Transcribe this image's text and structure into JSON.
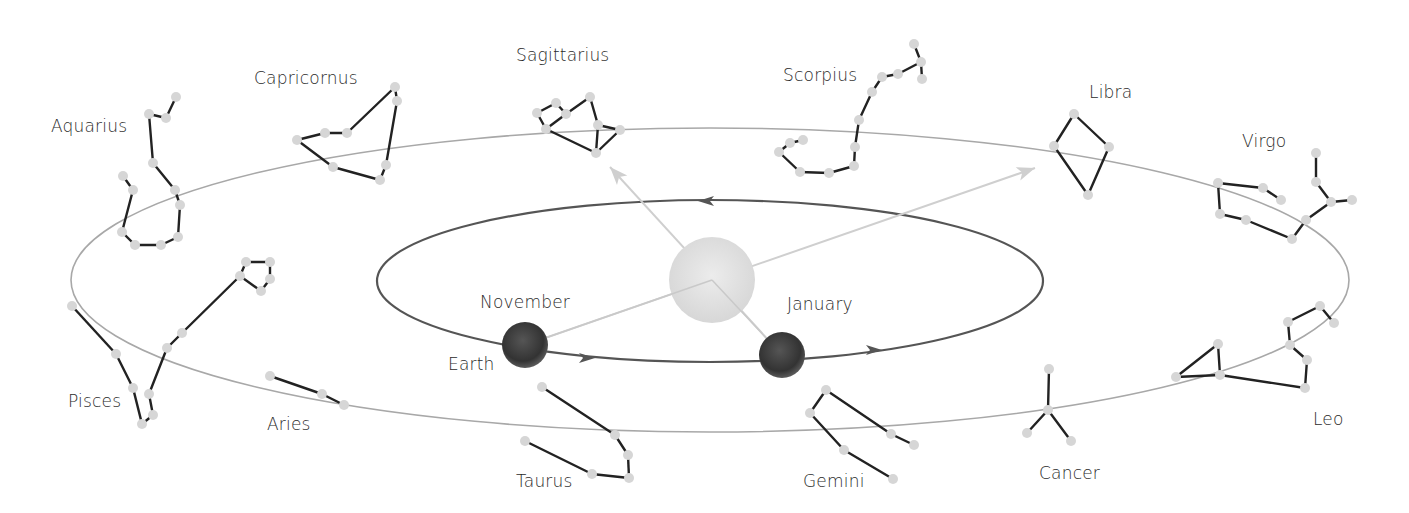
{
  "diagram": {
    "colors": {
      "background": "#ffffff",
      "ecliptic": "#a8a8a8",
      "orbit": "#555555",
      "sight_line": "#cfcfcf",
      "star": "#d6d6d6",
      "constellation_line": "#222222",
      "sun": "#dcdcdc",
      "earth": "#3a3a3a",
      "label": "#2b2b2b"
    },
    "ecliptic": {
      "cx": 710,
      "cy": 280,
      "rx": 639,
      "ry": 152
    },
    "orbit": {
      "cx": 710,
      "cy": 281,
      "rx": 333,
      "ry": 81,
      "arrows": [
        [
          588,
          358,
          1
        ],
        [
          875,
          350,
          1
        ],
        [
          705,
          201,
          -1
        ]
      ]
    },
    "sun": {
      "cx": 712,
      "cy": 280,
      "r": 43
    },
    "earth_positions": [
      {
        "name": "november",
        "label": "November",
        "cx": 525,
        "cy": 345,
        "r": 23
      },
      {
        "name": "january",
        "label": "January",
        "cx": 782,
        "cy": 355,
        "r": 23
      }
    ],
    "earth_label": "Earth",
    "sight_lines": [
      {
        "from": [
          525,
          345
        ],
        "to": [
          1035,
          168
        ]
      },
      {
        "from": [
          782,
          355
        ],
        "to": [
          610,
          167
        ]
      }
    ],
    "labels": [
      {
        "key": "aquarius",
        "text": "Aquarius",
        "x": 51,
        "y": 118
      },
      {
        "key": "capricornus",
        "text": "Capricornus",
        "x": 254,
        "y": 70
      },
      {
        "key": "sagittarius",
        "text": "Sagittarius",
        "x": 516,
        "y": 47
      },
      {
        "key": "scorpius",
        "text": "Scorpius",
        "x": 783,
        "y": 67
      },
      {
        "key": "libra",
        "text": "Libra",
        "x": 1089,
        "y": 84
      },
      {
        "key": "virgo",
        "text": "Virgo",
        "x": 1242,
        "y": 133
      },
      {
        "key": "leo",
        "text": "Leo",
        "x": 1313,
        "y": 411
      },
      {
        "key": "cancer",
        "text": "Cancer",
        "x": 1039,
        "y": 465
      },
      {
        "key": "gemini",
        "text": "Gemini",
        "x": 803,
        "y": 473
      },
      {
        "key": "taurus",
        "text": "Taurus",
        "x": 516,
        "y": 473
      },
      {
        "key": "aries",
        "text": "Aries",
        "x": 267,
        "y": 416
      },
      {
        "key": "pisces",
        "text": "Pisces",
        "x": 68,
        "y": 393
      },
      {
        "key": "november",
        "text": "November",
        "x": 480,
        "y": 294
      },
      {
        "key": "january",
        "text": "January",
        "x": 787,
        "y": 296
      },
      {
        "key": "earth",
        "text": "Earth",
        "x": 448,
        "y": 356
      }
    ],
    "constellations": [
      {
        "name": "Aquarius",
        "stars": [
          [
            176,
            97
          ],
          [
            166,
            118
          ],
          [
            149,
            114
          ],
          [
            153,
            163
          ],
          [
            175,
            190
          ],
          [
            180,
            205
          ],
          [
            178,
            237
          ],
          [
            161,
            245
          ],
          [
            135,
            245
          ],
          [
            122,
            232
          ],
          [
            133,
            190
          ],
          [
            123,
            176
          ]
        ],
        "lines": [
          [
            0,
            1
          ],
          [
            1,
            2
          ],
          [
            2,
            3
          ],
          [
            3,
            4
          ],
          [
            4,
            5
          ],
          [
            5,
            6
          ],
          [
            6,
            7
          ],
          [
            7,
            8
          ],
          [
            8,
            9
          ],
          [
            9,
            10
          ],
          [
            10,
            11
          ]
        ]
      },
      {
        "name": "Capricornus",
        "stars": [
          [
            395,
            87
          ],
          [
            397,
            101
          ],
          [
            347,
            133
          ],
          [
            325,
            133
          ],
          [
            297,
            140
          ],
          [
            333,
            167
          ],
          [
            380,
            180
          ],
          [
            386,
            165
          ]
        ],
        "lines": [
          [
            0,
            2
          ],
          [
            2,
            3
          ],
          [
            3,
            4
          ],
          [
            4,
            5
          ],
          [
            5,
            6
          ],
          [
            6,
            7
          ],
          [
            7,
            1
          ],
          [
            1,
            0
          ]
        ]
      },
      {
        "name": "Sagittarius",
        "stars": [
          [
            537,
            113
          ],
          [
            556,
            103
          ],
          [
            566,
            114
          ],
          [
            590,
            97
          ],
          [
            598,
            125
          ],
          [
            620,
            130
          ],
          [
            596,
            153
          ],
          [
            546,
            129
          ]
        ],
        "lines": [
          [
            0,
            1
          ],
          [
            1,
            2
          ],
          [
            2,
            7
          ],
          [
            7,
            0
          ],
          [
            2,
            3
          ],
          [
            3,
            4
          ],
          [
            4,
            5
          ],
          [
            5,
            6
          ],
          [
            6,
            4
          ],
          [
            7,
            6
          ]
        ]
      },
      {
        "name": "Scorpius",
        "stars": [
          [
            914,
            44
          ],
          [
            921,
            62
          ],
          [
            922,
            79
          ],
          [
            898,
            74
          ],
          [
            882,
            77
          ],
          [
            872,
            92
          ],
          [
            859,
            120
          ],
          [
            855,
            147
          ],
          [
            854,
            166
          ],
          [
            829,
            173
          ],
          [
            800,
            172
          ],
          [
            779,
            152
          ],
          [
            790,
            143
          ],
          [
            803,
            140
          ]
        ],
        "lines": [
          [
            0,
            1
          ],
          [
            1,
            2
          ],
          [
            1,
            3
          ],
          [
            3,
            4
          ],
          [
            4,
            5
          ],
          [
            5,
            6
          ],
          [
            6,
            7
          ],
          [
            7,
            8
          ],
          [
            8,
            9
          ],
          [
            9,
            10
          ],
          [
            10,
            11
          ],
          [
            11,
            12
          ],
          [
            12,
            13
          ]
        ]
      },
      {
        "name": "Libra",
        "stars": [
          [
            1074,
            114
          ],
          [
            1054,
            146
          ],
          [
            1109,
            147
          ],
          [
            1088,
            195
          ]
        ],
        "lines": [
          [
            0,
            1
          ],
          [
            0,
            2
          ],
          [
            1,
            3
          ],
          [
            2,
            3
          ]
        ]
      },
      {
        "name": "Virgo",
        "stars": [
          [
            1218,
            183
          ],
          [
            1263,
            188
          ],
          [
            1281,
            200
          ],
          [
            1220,
            214
          ],
          [
            1246,
            220
          ],
          [
            1292,
            239
          ],
          [
            1306,
            220
          ],
          [
            1331,
            202
          ],
          [
            1352,
            200
          ],
          [
            1316,
            182
          ],
          [
            1316,
            153
          ]
        ],
        "lines": [
          [
            0,
            1
          ],
          [
            1,
            2
          ],
          [
            0,
            3
          ],
          [
            3,
            4
          ],
          [
            4,
            5
          ],
          [
            5,
            6
          ],
          [
            6,
            7
          ],
          [
            7,
            8
          ],
          [
            7,
            9
          ],
          [
            9,
            10
          ]
        ]
      },
      {
        "name": "Leo",
        "stars": [
          [
            1176,
            377
          ],
          [
            1218,
            344
          ],
          [
            1220,
            375
          ],
          [
            1305,
            388
          ],
          [
            1307,
            360
          ],
          [
            1290,
            345
          ],
          [
            1288,
            322
          ],
          [
            1320,
            306
          ],
          [
            1334,
            323
          ]
        ],
        "lines": [
          [
            0,
            1
          ],
          [
            1,
            2
          ],
          [
            0,
            2
          ],
          [
            2,
            3
          ],
          [
            3,
            4
          ],
          [
            4,
            5
          ],
          [
            5,
            6
          ],
          [
            6,
            7
          ],
          [
            7,
            8
          ]
        ]
      },
      {
        "name": "Cancer",
        "stars": [
          [
            1049,
            369
          ],
          [
            1048,
            410
          ],
          [
            1027,
            433
          ],
          [
            1071,
            441
          ]
        ],
        "lines": [
          [
            0,
            1
          ],
          [
            1,
            2
          ],
          [
            1,
            3
          ]
        ]
      },
      {
        "name": "Gemini",
        "stars": [
          [
            826,
            390
          ],
          [
            810,
            413
          ],
          [
            844,
            450
          ],
          [
            893,
            479
          ],
          [
            891,
            434
          ],
          [
            914,
            445
          ]
        ],
        "lines": [
          [
            0,
            1
          ],
          [
            1,
            2
          ],
          [
            2,
            3
          ],
          [
            0,
            4
          ],
          [
            4,
            5
          ]
        ]
      },
      {
        "name": "Taurus",
        "stars": [
          [
            542,
            387
          ],
          [
            615,
            435
          ],
          [
            628,
            455
          ],
          [
            629,
            478
          ],
          [
            592,
            474
          ],
          [
            525,
            441
          ]
        ],
        "lines": [
          [
            0,
            1
          ],
          [
            1,
            2
          ],
          [
            2,
            3
          ],
          [
            3,
            4
          ],
          [
            4,
            5
          ]
        ]
      },
      {
        "name": "Aries",
        "stars": [
          [
            270,
            376
          ],
          [
            322,
            394
          ],
          [
            344,
            405
          ]
        ],
        "lines": [
          [
            0,
            1
          ],
          [
            1,
            2
          ]
        ]
      },
      {
        "name": "Pisces",
        "stars": [
          [
            72,
            306
          ],
          [
            116,
            354
          ],
          [
            133,
            388
          ],
          [
            142,
            424
          ],
          [
            153,
            415
          ],
          [
            149,
            394
          ],
          [
            167,
            348
          ],
          [
            182,
            333
          ],
          [
            240,
            276
          ],
          [
            246,
            262
          ],
          [
            270,
            262
          ],
          [
            270,
            279
          ],
          [
            261,
            291
          ]
        ],
        "lines": [
          [
            0,
            1
          ],
          [
            1,
            2
          ],
          [
            2,
            3
          ],
          [
            3,
            4
          ],
          [
            4,
            5
          ],
          [
            5,
            6
          ],
          [
            6,
            7
          ],
          [
            7,
            8
          ],
          [
            8,
            9
          ],
          [
            9,
            10
          ],
          [
            10,
            11
          ],
          [
            11,
            12
          ],
          [
            12,
            8
          ]
        ]
      }
    ]
  }
}
